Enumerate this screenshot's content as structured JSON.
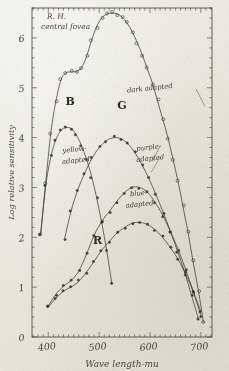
{
  "figure": {
    "title_line1": "R. H.",
    "title_line2": "central fovea",
    "paper_color": "#efeee8",
    "ink_color": "#3a3833"
  },
  "chart_data": {
    "type": "line",
    "xlabel": "Wave length-mu",
    "ylabel": "Log relative sensitivity",
    "xlim": [
      368,
      722
    ],
    "ylim": [
      0,
      6.6
    ],
    "xticks": [
      400,
      500,
      600,
      700
    ],
    "xticklabels": [
      "400",
      "500",
      "600",
      "700"
    ],
    "yticks": [
      0,
      1,
      2,
      3,
      4,
      5,
      6
    ],
    "yticklabels": [
      "0",
      "1",
      "2",
      "3",
      "4",
      "5",
      "6"
    ],
    "grid": false,
    "legend": "inline-annotations",
    "annotations": [
      {
        "text": "dark adapted",
        "x": 600,
        "y": 4.95
      },
      {
        "text": "yellow-",
        "x": 452,
        "y": 3.72
      },
      {
        "text": "adapted",
        "x": 455,
        "y": 3.5
      },
      {
        "text": "purple-",
        "x": 598,
        "y": 3.76
      },
      {
        "text": "adapted",
        "x": 601,
        "y": 3.54
      },
      {
        "text": "blue-",
        "x": 578,
        "y": 2.84
      },
      {
        "text": "adapted",
        "x": 580,
        "y": 2.62
      },
      {
        "text": "B",
        "x": 443,
        "y": 4.66
      },
      {
        "text": "G",
        "x": 545,
        "y": 4.58
      },
      {
        "text": "R",
        "x": 497,
        "y": 1.86
      }
    ],
    "series": [
      {
        "name": "dark adapted",
        "marker": "open-circle",
        "x": [
          385,
          395,
          405,
          415,
          425,
          435,
          445,
          455,
          465,
          475,
          485,
          495,
          505,
          515,
          525,
          535,
          545,
          555,
          565,
          575,
          585,
          595,
          605,
          615,
          625,
          635,
          645,
          655,
          665,
          675,
          685,
          695,
          705
        ],
        "y": [
          2.05,
          3.1,
          4.1,
          4.72,
          5.16,
          5.3,
          5.32,
          5.33,
          5.4,
          5.62,
          5.95,
          6.22,
          6.4,
          6.48,
          6.5,
          6.48,
          6.42,
          6.3,
          6.12,
          5.9,
          5.66,
          5.38,
          5.08,
          4.74,
          4.38,
          4.0,
          3.58,
          3.12,
          2.62,
          2.1,
          1.52,
          0.92,
          0.3
        ]
      },
      {
        "name": "B yellow-adapted",
        "marker": "filled-circle",
        "x": [
          385,
          395,
          405,
          415,
          425,
          435,
          445,
          455,
          465,
          475,
          485,
          495,
          505,
          515,
          525
        ],
        "y": [
          2.08,
          3.02,
          3.62,
          3.96,
          4.14,
          4.2,
          4.18,
          4.06,
          3.86,
          3.58,
          3.22,
          2.8,
          2.3,
          1.72,
          1.06
        ]
      },
      {
        "name": "G purple-adapted",
        "marker": "filled-circle",
        "x": [
          432,
          445,
          458,
          472,
          486,
          500,
          514,
          528,
          542,
          556,
          570,
          584,
          598,
          612,
          626,
          640,
          654,
          668,
          682,
          696
        ],
        "y": [
          1.98,
          2.52,
          2.96,
          3.3,
          3.58,
          3.8,
          3.94,
          4.0,
          3.98,
          3.88,
          3.7,
          3.46,
          3.18,
          2.86,
          2.5,
          2.12,
          1.72,
          1.3,
          0.84,
          0.34
        ]
      },
      {
        "name": "blue-adapted",
        "marker": "filled-circle",
        "x": [
          400,
          415,
          430,
          445,
          460,
          475,
          490,
          505,
          520,
          535,
          550,
          565,
          580,
          595,
          610,
          625,
          640,
          655,
          670,
          685,
          700
        ],
        "y": [
          0.62,
          0.86,
          1.02,
          1.14,
          1.32,
          1.66,
          2.04,
          2.32,
          2.52,
          2.72,
          2.9,
          3.0,
          3.0,
          2.9,
          2.7,
          2.44,
          2.12,
          1.76,
          1.36,
          0.92,
          0.42
        ]
      },
      {
        "name": "R",
        "marker": "filled-circle",
        "x": [
          400,
          415,
          430,
          445,
          460,
          475,
          490,
          505,
          520,
          535,
          550,
          565,
          580,
          595,
          610,
          625,
          640,
          655,
          670,
          685,
          700
        ],
        "y": [
          0.6,
          0.78,
          0.92,
          1.0,
          1.12,
          1.3,
          1.52,
          1.74,
          1.92,
          2.08,
          2.2,
          2.28,
          2.3,
          2.26,
          2.16,
          2.0,
          1.8,
          1.56,
          1.26,
          0.92,
          0.52
        ]
      }
    ]
  }
}
